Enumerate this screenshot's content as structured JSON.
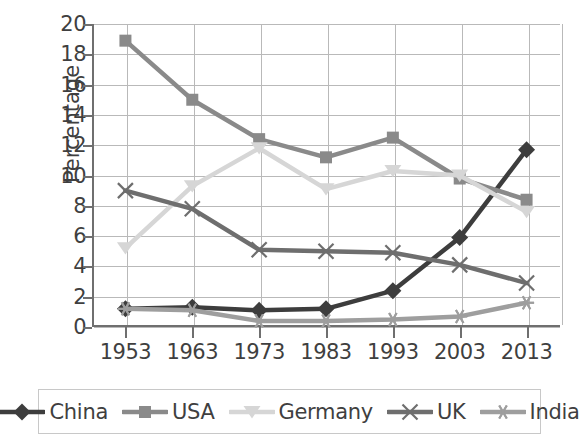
{
  "chart_data": {
    "type": "line",
    "title": "",
    "xlabel": "",
    "ylabel": "Percentage",
    "categories": [
      "1953",
      "1963",
      "1973",
      "1983",
      "1993",
      "2003",
      "2013"
    ],
    "x": [
      1953,
      1963,
      1973,
      1983,
      1993,
      2003,
      2013
    ],
    "ylim": [
      0,
      20
    ],
    "ytick_values": [
      0,
      2,
      4,
      6,
      8,
      10,
      12,
      14,
      16,
      18,
      20
    ],
    "ytick_labels": [
      "0",
      "2",
      "4",
      "6",
      "8",
      "10",
      "12",
      "14",
      "16",
      "18",
      "20"
    ],
    "grid": true,
    "legend_position": "bottom",
    "series": [
      {
        "name": "China",
        "marker": "diamond",
        "color": "#3d3d3d",
        "values": [
          1.2,
          1.3,
          1.1,
          1.2,
          2.4,
          5.9,
          11.7
        ]
      },
      {
        "name": "USA",
        "marker": "square",
        "color": "#8a8a8a",
        "values": [
          18.9,
          15.0,
          12.4,
          11.2,
          12.5,
          9.8,
          8.4
        ]
      },
      {
        "name": "Germany",
        "marker": "triangle",
        "color": "#d6d6d6",
        "values": [
          5.2,
          9.3,
          11.8,
          9.1,
          10.3,
          10.0,
          7.6
        ]
      },
      {
        "name": "UK",
        "marker": "x",
        "color": "#6e6e6e",
        "values": [
          9.0,
          7.8,
          5.1,
          5.0,
          4.9,
          4.1,
          2.9
        ]
      },
      {
        "name": "India",
        "marker": "asterisk",
        "color": "#9e9e9e",
        "values": [
          1.2,
          1.1,
          0.4,
          0.4,
          0.5,
          0.7,
          1.6
        ]
      }
    ]
  },
  "legend": {
    "items": [
      "China",
      "USA",
      "Germany",
      "UK",
      "India"
    ]
  },
  "colors": {
    "axis": "#6f6f6f",
    "grid": "#b9b9b9",
    "text": "#3f3f3f",
    "background": "#ffffff",
    "legend_border": "#c8c8c8"
  }
}
